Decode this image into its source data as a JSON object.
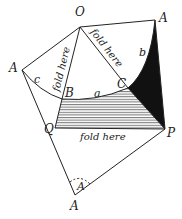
{
  "diagram": {
    "type": "geometry-fold-construction",
    "points": {
      "O": "O",
      "A_top_right": "A",
      "A_left": "A",
      "A_bottom": "A",
      "B": "B",
      "C": "C",
      "Q": "Q",
      "P": "P"
    },
    "segments": {
      "a": "a",
      "b": "b",
      "c": "c"
    },
    "angle_label": "A",
    "fold_labels": {
      "left": "fold here",
      "right": "fold here",
      "bottom": "fold here"
    },
    "colors": {
      "line": "#222222",
      "fill_dark": "#111111",
      "hatch": "#444444",
      "background": "#ffffff"
    }
  }
}
